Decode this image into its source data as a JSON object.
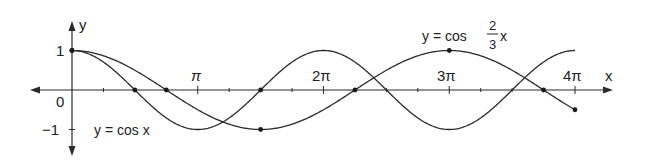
{
  "chart_data": {
    "type": "line",
    "title": "",
    "xlabel": "x",
    "ylabel": "y",
    "x_ticks": [
      {
        "value": 3.14159,
        "label": "π"
      },
      {
        "value": 6.28319,
        "label": "2π"
      },
      {
        "value": 9.42478,
        "label": "3π"
      },
      {
        "value": 12.56637,
        "label": "4π"
      }
    ],
    "y_ticks": [
      {
        "value": 1,
        "label": "1"
      },
      {
        "value": -1,
        "label": "−1"
      }
    ],
    "origin_label": "0",
    "xlim": [
      0,
      12.566
    ],
    "ylim": [
      -1,
      1
    ],
    "grid": false,
    "series": [
      {
        "name": "y = cos x",
        "function": "cos(x)",
        "domain": [
          0,
          12.566
        ],
        "marked_points": [
          [
            0,
            1
          ],
          [
            1.5708,
            0
          ],
          [
            4.7124,
            0
          ]
        ]
      },
      {
        "name": "y = cos (2/3)x",
        "function": "cos(2x/3)",
        "domain": [
          0,
          12.566
        ],
        "marked_points": [
          [
            0,
            1
          ],
          [
            2.3562,
            0
          ],
          [
            4.7124,
            -1
          ],
          [
            7.0686,
            0
          ],
          [
            9.4248,
            1
          ],
          [
            11.781,
            0
          ],
          [
            12.566,
            -0.5
          ]
        ]
      }
    ],
    "annotations": [
      {
        "text": "y = cos x",
        "near": "x≈π/2, y≈-1"
      },
      {
        "text": "y = cos (2/3)x",
        "near": "x≈3π, y≈1"
      }
    ]
  },
  "labels": {
    "y_axis": "y",
    "x_axis": "x",
    "origin": "0",
    "y_one": "1",
    "y_neg_one": "−1",
    "pi": "π",
    "two_pi": "2π",
    "three_pi": "3π",
    "four_pi": "4π",
    "cos_x_label": "y = cos x",
    "cos23_prefix": "y = cos",
    "cos23_num": "2",
    "cos23_den": "3",
    "cos23_var": "x"
  }
}
